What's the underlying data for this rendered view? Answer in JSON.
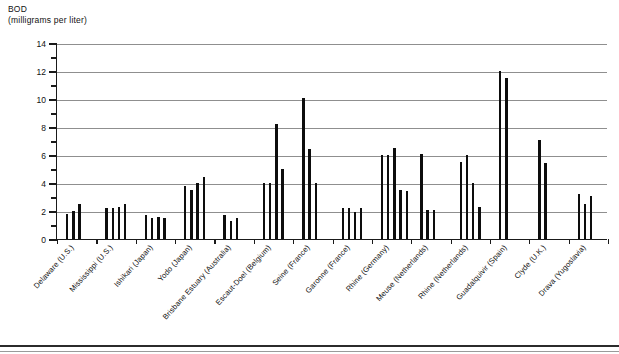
{
  "chart_data": {
    "type": "bar",
    "title": "",
    "ylabel": "BOD",
    "ylabel_units": "(milligrams per liter)",
    "xlabel": "",
    "ylim": [
      0,
      14
    ],
    "ytick_step": 2,
    "yminor_step": 1,
    "grid": true,
    "legend": null,
    "ytick_labels": [
      "0",
      "2",
      "4",
      "6",
      "8",
      "10",
      "12",
      "14"
    ],
    "categories": [
      "Delaware (U.S.)",
      "Mississippi (U.S.)",
      "Ishikari (Japan)",
      "Yodo (Japan)",
      "Brisbane Estuary (Australia)",
      "Escaut-Doel (Belgium)",
      "Seine (France)",
      "Garonne (France)",
      "Rhine (Germany)",
      "Meuse (Netherlands)",
      "Rhine (Netherlands)",
      "Guadalquivir (Spain)",
      "Clyde (U.K.)",
      "Drava (Yugoslavia)"
    ],
    "groups": [
      {
        "name": "Delaware (U.S.)",
        "values": [
          1.8,
          2.0,
          2.5
        ]
      },
      {
        "name": "Mississippi (U.S.)",
        "values": [
          2.2,
          2.2,
          2.3,
          2.5
        ]
      },
      {
        "name": "Ishikari (Japan)",
        "values": [
          1.7,
          1.5,
          1.6,
          1.5
        ]
      },
      {
        "name": "Yodo (Japan)",
        "values": [
          3.8,
          3.5,
          4.0,
          4.4
        ]
      },
      {
        "name": "Brisbane Estuary (Australia)",
        "values": [
          1.7,
          1.3,
          1.5
        ]
      },
      {
        "name": "Escaut-Doel (Belgium)",
        "values": [
          4.0,
          4.0,
          8.2,
          5.0
        ]
      },
      {
        "name": "Seine (France)",
        "values": [
          10.1,
          6.4,
          4.0
        ]
      },
      {
        "name": "Garonne (France)",
        "values": [
          2.2,
          2.2,
          1.9,
          2.2
        ]
      },
      {
        "name": "Rhine (Germany)",
        "values": [
          6.0,
          6.0,
          6.5,
          3.5,
          3.4
        ]
      },
      {
        "name": "Meuse (Netherlands)",
        "values": [
          6.1,
          2.1,
          2.1
        ]
      },
      {
        "name": "Rhine (Netherlands)",
        "values": [
          5.5,
          6.0,
          4.0,
          2.3
        ]
      },
      {
        "name": "Guadalquivir (Spain)",
        "values": [
          12.0,
          11.5
        ]
      },
      {
        "name": "Clyde (U.K.)",
        "values": [
          7.1,
          5.4
        ]
      },
      {
        "name": "Drava (Yugoslavia)",
        "values": [
          3.2,
          2.5,
          3.1
        ]
      }
    ],
    "colors": {
      "bar": "#0d0d0d",
      "grid": "#8f8f8f",
      "axis": "#1a1a1a",
      "background": "#ffffff"
    }
  }
}
